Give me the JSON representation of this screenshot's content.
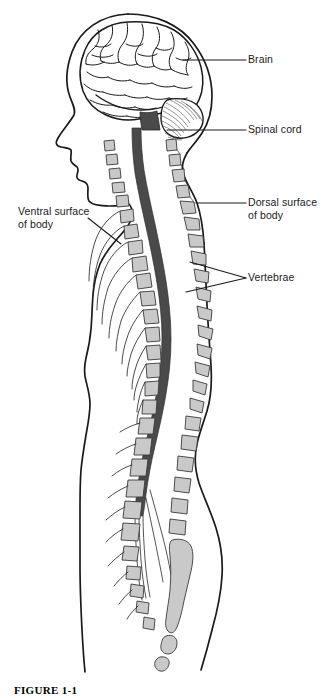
{
  "figure": {
    "caption": "FIGURE 1-1",
    "width": 327,
    "height": 697,
    "background_color": "#ffffff"
  },
  "colors": {
    "outline": "#1a1a1a",
    "spinal_cord_fill": "#4a4a4a",
    "vertebra_fill": "#c9c9c9",
    "vertebra_stroke": "#3a3a3a",
    "label_text": "#1a1a1a",
    "leader_line": "#1a1a1a",
    "background": "#ffffff"
  },
  "labels": {
    "brain": "Brain",
    "spinal_cord": "Spinal cord",
    "dorsal_surface": "Dorsal surface\nof body",
    "vertebrae": "Vertebrae",
    "ventral_surface": "Ventral surface\nof body"
  },
  "structures": [
    {
      "name": "brain",
      "label": "Brain",
      "fill": "#ffffff"
    },
    {
      "name": "cerebellum",
      "label": "Cerebellum",
      "fill": "#ffffff"
    },
    {
      "name": "spinal-cord",
      "label": "Spinal cord",
      "fill": "#4a4a4a"
    },
    {
      "name": "vertebrae",
      "label": "Vertebrae",
      "fill": "#c9c9c9"
    },
    {
      "name": "sacrum",
      "label": "Sacrum",
      "fill": "#c9c9c9"
    },
    {
      "name": "body-outline",
      "label": "Body outline",
      "fill": "none"
    },
    {
      "name": "ribs",
      "label": "Ribs",
      "fill": "none"
    },
    {
      "name": "cauda-equina",
      "label": "Cauda equina",
      "fill": "none"
    }
  ],
  "leaders": {
    "brain": {
      "from_x": 246,
      "from_y": 60,
      "to_x": 183,
      "to_y": 60
    },
    "spinal_cord": {
      "from_x": 246,
      "from_y": 130,
      "to_x": 167,
      "to_y": 130
    },
    "dorsal_surface": {
      "from_x": 246,
      "from_y": 203,
      "to_x": 196,
      "to_y": 203
    },
    "vertebrae": {
      "from_x": 246,
      "from_y": 278,
      "to_x": 185,
      "to_y": 265
    },
    "ventral_surface": {
      "from_x": 88,
      "from_y": 218,
      "to_x": 120,
      "to_y": 243
    }
  }
}
